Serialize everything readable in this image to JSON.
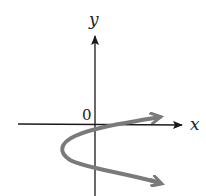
{
  "diagram": {
    "x_axis_label": "x",
    "y_axis_label": "y",
    "origin_label": "0",
    "curve_color": "#7a7a7a",
    "axis_color": "#1a1a1a",
    "curve_description": "sideways parabola opening to the right, vertex left of the y-axis below the origin, with arrowheads on both ends"
  }
}
